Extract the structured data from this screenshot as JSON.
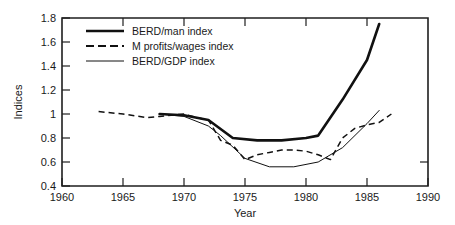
{
  "chart_data": {
    "type": "line",
    "title": "",
    "xlabel": "Year",
    "ylabel": "Indices",
    "xlim": [
      1960,
      1990
    ],
    "ylim": [
      0.4,
      1.8
    ],
    "xticks": [
      1960,
      1965,
      1970,
      1975,
      1980,
      1985,
      1990
    ],
    "xtick_labels": [
      "1960",
      "1965",
      "1970",
      "1975",
      "1980",
      "1985",
      "1990"
    ],
    "yticks": [
      0.4,
      0.6,
      0.8,
      1.0,
      1.2,
      1.4,
      1.6,
      1.8
    ],
    "ytick_labels": [
      "0.4",
      "0.6",
      "0.8",
      "1",
      "1.2",
      "1.4",
      "1.6",
      "1.8"
    ],
    "grid": false,
    "legend_position": "upper-left-inside",
    "series": [
      {
        "name": "BERD/man index",
        "style": "solid-thick",
        "x": [
          1968,
          1970,
          1972,
          1974,
          1976,
          1978,
          1980,
          1981,
          1983,
          1985,
          1986
        ],
        "values": [
          1.0,
          0.99,
          0.95,
          0.8,
          0.78,
          0.78,
          0.8,
          0.82,
          1.12,
          1.45,
          1.75
        ]
      },
      {
        "name": "M profits/wages index",
        "style": "dashed",
        "x": [
          1963,
          1965,
          1967,
          1968,
          1970,
          1971,
          1972,
          1973,
          1974,
          1975,
          1976,
          1977,
          1978,
          1979,
          1980,
          1981,
          1982,
          1983,
          1984,
          1985,
          1986,
          1987
        ],
        "values": [
          1.02,
          1.0,
          0.97,
          0.98,
          1.0,
          0.97,
          0.95,
          0.78,
          0.74,
          0.62,
          0.66,
          0.68,
          0.7,
          0.7,
          0.69,
          0.66,
          0.62,
          0.8,
          0.88,
          0.91,
          0.93,
          1.0
        ]
      },
      {
        "name": "BERD/GDP index",
        "style": "solid-thin",
        "x": [
          1968,
          1970,
          1972,
          1973,
          1975,
          1977,
          1979,
          1981,
          1983,
          1985,
          1986
        ],
        "values": [
          1.0,
          0.98,
          0.9,
          0.82,
          0.63,
          0.56,
          0.56,
          0.6,
          0.72,
          0.92,
          1.03
        ]
      }
    ]
  },
  "legend": {
    "items": [
      {
        "label": "BERD/man index",
        "style": "solid-thick"
      },
      {
        "label": "M profits/wages index",
        "style": "dashed"
      },
      {
        "label": "BERD/GDP index",
        "style": "solid-thin"
      }
    ]
  }
}
